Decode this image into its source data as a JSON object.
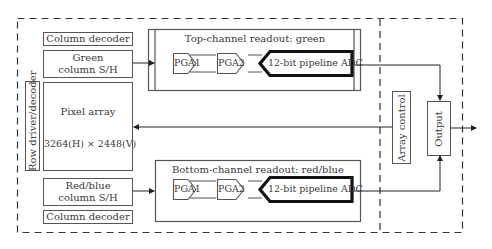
{
  "diagram": {
    "type": "block-diagram",
    "left_block": {
      "column_decoder_top": "Column decoder",
      "green_sh_line1": "Green",
      "green_sh_line2": "column S/H",
      "pixel_array_title": "Pixel array",
      "pixel_array_size": "3264(H) × 2448(V)",
      "row_driver": "Row driver/decoder",
      "redblue_sh_line1": "Red/blue",
      "redblue_sh_line2": "column S/H",
      "column_decoder_bottom": "Column decoder"
    },
    "top_channel": {
      "title": "Top-channel readout: green",
      "pga1": "PGA1",
      "pga2": "PGA2",
      "adc": "12-bit pipeline ADC"
    },
    "bottom_channel": {
      "title": "Bottom-channel readout: red/blue",
      "pga1": "PGA1",
      "pga2": "PGA2",
      "adc": "12-bit pipeline ADC"
    },
    "right_block": {
      "array_control": "Array control",
      "output": "Output"
    }
  }
}
